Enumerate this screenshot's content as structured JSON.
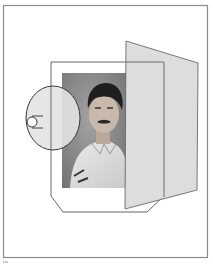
{
  "figure": {
    "colors": {
      "background": "#ffffff",
      "frame_stroke": "#8a8a8a",
      "line_stroke": "#555555",
      "panel_fill": "#d6d6d6",
      "panel_stroke": "#6a6a6a",
      "eye_fill": "#e2e2e2",
      "photo_bg": "#8c8c8c"
    },
    "elements": {
      "outer_frame": "border",
      "paper": "picture-frame-outline",
      "photo": "portrait-photograph",
      "panel": "translucent-picture-plane",
      "eye": "eye-ellipse",
      "pupil": "pupil-circle"
    }
  }
}
